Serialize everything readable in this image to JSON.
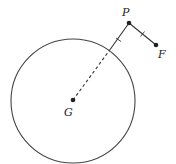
{
  "diagram": {
    "type": "geometry",
    "circle": {
      "cx": 73,
      "cy": 101,
      "r": 62,
      "stroke": "#444444"
    },
    "points": {
      "G": {
        "label": "G",
        "x": 73,
        "y": 100
      },
      "P": {
        "label": "P",
        "x": 129,
        "y": 23
      },
      "F": {
        "label": "F",
        "x": 156,
        "y": 45
      }
    },
    "segments": [
      {
        "from": "G",
        "to": "P",
        "style": "dashed inside circle, solid outside",
        "tick_marks": 1
      },
      {
        "from": "P",
        "to": "F",
        "style": "solid",
        "tick_marks": 1
      }
    ],
    "colors": {
      "line": "#333333",
      "point": "#222222"
    }
  }
}
